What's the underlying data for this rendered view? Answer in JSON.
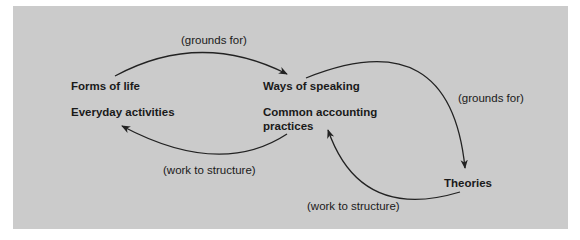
{
  "diagram": {
    "nodes": {
      "forms_of_life": "Forms of life",
      "everyday_activities": "Everyday activities",
      "ways_of_speaking": "Ways of speaking",
      "common_accounting_1": "Common accounting",
      "common_accounting_2": "practices",
      "theories": "Theories"
    },
    "edges": {
      "top_left": "(grounds for)",
      "right": "(grounds for)",
      "bottom_left": "(work to structure)",
      "bottom_right": "(work to structure)"
    },
    "colors": {
      "panel_background": "#cbcbcb",
      "text": "#1a1a1a",
      "arrow": "#222222"
    }
  }
}
